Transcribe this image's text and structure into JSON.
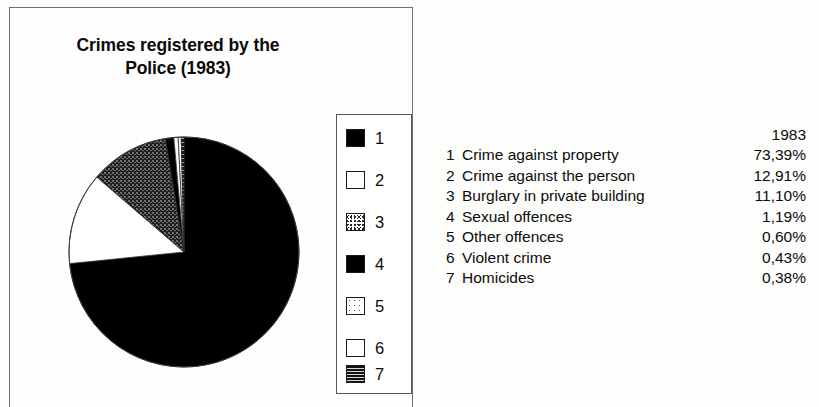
{
  "chart_panel": {
    "title_line1": "Crimes registered by the",
    "title_line2": "Police (1983)"
  },
  "legend": {
    "entries": [
      {
        "num": "1",
        "pattern": "solid-black"
      },
      {
        "num": "2",
        "pattern": "white-outline"
      },
      {
        "num": "3",
        "pattern": "dithered-speckle"
      },
      {
        "num": "4",
        "pattern": "solid-black"
      },
      {
        "num": "5",
        "pattern": "white-light-speckle"
      },
      {
        "num": "6",
        "pattern": "white-outline"
      },
      {
        "num": "7",
        "pattern": "dark-horizontal-lines"
      }
    ]
  },
  "table": {
    "year_header": "1983",
    "rows": [
      {
        "index": "1",
        "label": "Crime against property",
        "value": "73,39%"
      },
      {
        "index": "2",
        "label": "Crime against the person",
        "value": "12,91%"
      },
      {
        "index": "3",
        "label": "Burglary in private building",
        "value": "11,10%"
      },
      {
        "index": "4",
        "label": "Sexual offences",
        "value": "1,19%"
      },
      {
        "index": "5",
        "label": "Other offences",
        "value": "0,60%"
      },
      {
        "index": "6",
        "label": "Violent crime",
        "value": "0,43%"
      },
      {
        "index": "7",
        "label": "Homicides",
        "value": "0,38%"
      }
    ]
  },
  "chart_data": {
    "type": "pie",
    "title": "Crimes registered by the Police (1983)",
    "year": "1983",
    "unit": "percent",
    "decimal_separator": ",",
    "start_angle_deg": 0,
    "direction": "clockwise",
    "legend_position": "right-inside-panel",
    "categories": [
      "Crime against property",
      "Crime against the person",
      "Burglary in private building",
      "Sexual offences",
      "Other offences",
      "Violent crime",
      "Homicides"
    ],
    "values": [
      73.39,
      12.91,
      11.1,
      1.19,
      0.6,
      0.43,
      0.38
    ],
    "labels": [
      "73,39%",
      "12,91%",
      "11,10%",
      "1,19%",
      "0,60%",
      "0,43%",
      "0,38%"
    ],
    "slice_fills": [
      "solid-black",
      "white-outline",
      "dithered-speckle",
      "solid-black",
      "white-light-speckle",
      "white-outline",
      "dark-horizontal-lines"
    ],
    "colors": [
      "#000000",
      "#ffffff",
      "#2a2a2a",
      "#000000",
      "#ffffff",
      "#ffffff",
      "#111111"
    ],
    "total": 100.0
  }
}
